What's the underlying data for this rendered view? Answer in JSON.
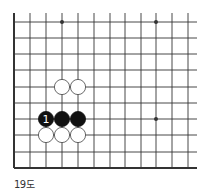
{
  "diagram": {
    "type": "go-board-partial",
    "caption": "19도",
    "grid": {
      "x_lines": [
        14,
        30,
        46,
        62,
        78,
        94,
        110,
        125,
        141,
        156,
        172,
        188
      ],
      "y_lines": [
        22,
        38,
        54,
        70,
        87,
        103,
        119,
        135,
        152,
        168
      ],
      "right_extent": 197,
      "top_extent": 13,
      "left_edge_thick": true,
      "bottom_edge_thick": true
    },
    "star_points": [
      {
        "col": 3,
        "row": 0
      },
      {
        "col": 9,
        "row": 0
      },
      {
        "col": 9,
        "row": 6
      }
    ],
    "stones": [
      {
        "color": "white",
        "col": 3,
        "row": 4
      },
      {
        "color": "white",
        "col": 4,
        "row": 4
      },
      {
        "color": "black",
        "col": 2,
        "row": 6,
        "label": "1"
      },
      {
        "color": "black",
        "col": 3,
        "row": 6
      },
      {
        "color": "black",
        "col": 4,
        "row": 6
      },
      {
        "color": "white",
        "col": 2,
        "row": 7
      },
      {
        "color": "white",
        "col": 3,
        "row": 7
      },
      {
        "color": "white",
        "col": 4,
        "row": 7
      }
    ],
    "colors": {
      "line": "#333333",
      "black_stone": "#111111",
      "white_stone": "#ffffff",
      "stone_outline": "#444444",
      "label_on_black": "#ffffff"
    }
  }
}
